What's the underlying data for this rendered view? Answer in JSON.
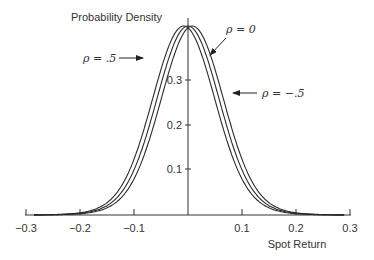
{
  "chart_data": {
    "type": "line",
    "title": "",
    "ylabel": "Probability Density",
    "xlabel": "Spot Return",
    "xlim": [
      -0.3,
      0.3
    ],
    "ylim": [
      0,
      0.42
    ],
    "x_ticks": [
      "-0.3",
      "-0.2",
      "-0.1",
      "0.1",
      "0.2",
      "0.3"
    ],
    "x_tick_values": [
      -0.3,
      -0.2,
      -0.1,
      0.1,
      0.2,
      0.3
    ],
    "y_ticks": [
      "0.1",
      "0.2",
      "0.3"
    ],
    "y_tick_values": [
      0.1,
      0.2,
      0.3
    ],
    "grid": false,
    "legend": "inline annotations with arrows",
    "x": [
      -0.28,
      -0.24,
      -0.2,
      -0.16,
      -0.12,
      -0.1,
      -0.08,
      -0.06,
      -0.04,
      -0.02,
      0.0,
      0.02,
      0.04,
      0.06,
      0.08,
      0.1,
      0.12,
      0.16,
      0.2,
      0.24,
      0.28
    ],
    "series": [
      {
        "name": "ρ = .5",
        "center": -0.008,
        "peak": 0.42,
        "values": [
          0.004,
          0.009,
          0.022,
          0.05,
          0.11,
          0.155,
          0.21,
          0.275,
          0.34,
          0.395,
          0.418,
          0.405,
          0.36,
          0.29,
          0.215,
          0.145,
          0.09,
          0.035,
          0.013,
          0.005,
          0.002
        ]
      },
      {
        "name": "ρ = 0",
        "center": 0.0,
        "peak": 0.42,
        "values": [
          0.003,
          0.008,
          0.02,
          0.045,
          0.1,
          0.14,
          0.195,
          0.26,
          0.325,
          0.385,
          0.42,
          0.41,
          0.375,
          0.305,
          0.23,
          0.16,
          0.1,
          0.04,
          0.015,
          0.006,
          0.002
        ]
      },
      {
        "name": "ρ = -.5",
        "center": 0.008,
        "peak": 0.42,
        "values": [
          0.002,
          0.006,
          0.016,
          0.038,
          0.09,
          0.125,
          0.178,
          0.24,
          0.31,
          0.375,
          0.412,
          0.418,
          0.39,
          0.325,
          0.248,
          0.175,
          0.112,
          0.046,
          0.018,
          0.007,
          0.003
        ]
      }
    ],
    "annotations": [
      {
        "text": "ρ = .5",
        "points_to": "ρ = .5",
        "arrow": "right"
      },
      {
        "text": "ρ = 0",
        "points_to": "ρ = 0",
        "arrow": "down-left"
      },
      {
        "text": "ρ = −.5",
        "points_to": "ρ = -.5",
        "arrow": "left"
      }
    ]
  },
  "labels": {
    "ylabel": "Probability Density",
    "xlabel": "Spot Return",
    "rho_pos": "ρ = .5",
    "rho_zero": "ρ = 0",
    "rho_neg": "ρ = −.5",
    "xt0": "−0.3",
    "xt1": "−0.2",
    "xt2": "−0.1",
    "xt3": "0.1",
    "xt4": "0.2",
    "xt5": "0.3",
    "yt1": "0.1",
    "yt2": "0.2",
    "yt3": "0.3"
  }
}
